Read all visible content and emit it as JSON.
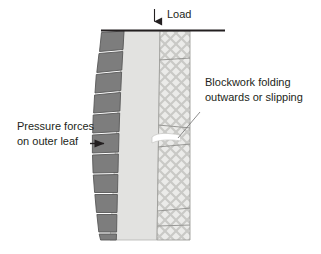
{
  "diagram": {
    "title_visible": false,
    "background_color": "#ffffff",
    "labels": {
      "load": "Load",
      "blockwork_line1": "Blockwork folding",
      "blockwork_line2": "outwards or slipping",
      "pressure_line1": "Pressure forces",
      "pressure_line2": "on outer leaf"
    },
    "colors": {
      "outer_leaf_brick": "#7d7d7d",
      "outer_leaf_brick_stroke": "#5a5a5a",
      "cavity_fill": "#e2e2e0",
      "cavity_stroke": "#b5b5b3",
      "inner_leaf_fill": "#ebebe9",
      "inner_leaf_hatch": "#c9c9c6",
      "inner_leaf_stroke": "#a8a8a5",
      "hinge_gap": "#ffffff",
      "line_dark": "#231f20",
      "text": "#231f20",
      "leader_line": "#6f6f6f"
    },
    "elements": {
      "load_arrow": "down-arrow-icon",
      "pressure_arrow": "right-arrow-icon",
      "slab_line": "horizontal-slab-line",
      "leader": "callout-leader-line",
      "outer_leaf_block_count": 11,
      "inner_leaf_joint_count": 4
    }
  }
}
